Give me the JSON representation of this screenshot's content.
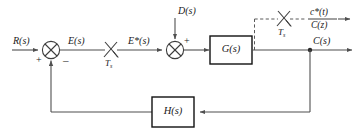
{
  "diagram": {
    "type": "control-system-block-diagram",
    "colors": {
      "wire": "#4f4f4f",
      "dashed_wire": "#5a5a5a",
      "block_border": "#111111",
      "text": "#1a1a1a",
      "background": "#ffffff"
    },
    "signals": {
      "reference_input": "R(s)",
      "error": "E(s)",
      "sampled_error": "E*(s)",
      "disturbance": "D(s)",
      "output": "C(s)",
      "sampled_output_time": "c*(t)",
      "sampled_output_z": "C(z)"
    },
    "blocks": [
      {
        "id": "plant",
        "label": "G(s)"
      },
      {
        "id": "feedback",
        "label": "H(s)"
      }
    ],
    "samplers": [
      {
        "id": "input-sampler",
        "label": "T",
        "subscript": "s"
      },
      {
        "id": "output-sampler",
        "label": "T",
        "subscript": "s"
      }
    ],
    "summing_junctions": [
      {
        "id": "error-summer",
        "signs": [
          {
            "value": "+",
            "position": "left-bottom"
          },
          {
            "value": "–",
            "position": "right-bottom"
          }
        ]
      },
      {
        "id": "disturbance-summer",
        "signs": [
          {
            "value": "+",
            "position": "top-right"
          }
        ]
      }
    ]
  }
}
